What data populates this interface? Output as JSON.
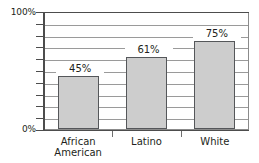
{
  "chart_data": {
    "type": "bar",
    "title": "",
    "subtitle": "",
    "xlabel": "",
    "ylabel": "",
    "categories": [
      "African\nAmerican",
      "Latino",
      "White"
    ],
    "values": [
      45,
      61,
      75
    ],
    "value_labels": [
      "45%",
      "61%",
      "75%"
    ],
    "ylim": [
      0,
      100
    ],
    "ytick_labels": [
      "0%",
      "100%"
    ],
    "ytick_values": [
      0,
      100
    ],
    "gridline_values": [
      10,
      20,
      30,
      40,
      50,
      60,
      70,
      80,
      90,
      100
    ],
    "grid": true,
    "legend": false,
    "legend_position": "none",
    "bar_fill_color": "#cdcdcd",
    "bar_border_color": "#55575a",
    "gridline_color": "#9a9a9a",
    "axis_color": "#4d4d4d",
    "background_color": "#ffffff"
  },
  "axis": {
    "y_top_label": "100%",
    "y_bottom_label": "0%"
  },
  "bars": [
    {
      "label": "African\nAmerican",
      "value_label": "45%",
      "value": 45
    },
    {
      "label": "Latino",
      "value_label": "61%",
      "value": 61
    },
    {
      "label": "White",
      "value_label": "75%",
      "value": 75
    }
  ]
}
